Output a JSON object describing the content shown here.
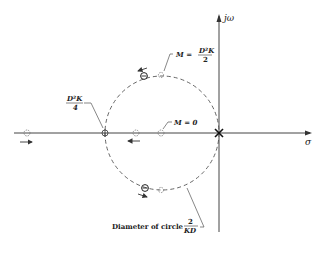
{
  "diagram": {
    "type": "root-locus",
    "axes": {
      "vertical_label": "jω",
      "horizontal_label": "σ"
    },
    "labels": {
      "m_top": {
        "lhs": "M =",
        "num": "D²K",
        "den": "2"
      },
      "break_in": {
        "num": "D²K",
        "den": "4"
      },
      "m_zero": "M = 0",
      "diameter": {
        "text": "Diameter of circle",
        "num": "2",
        "den": "KD"
      }
    },
    "colors": {
      "line": "#333333",
      "dashed_circle": "#555555",
      "background": "#ffffff"
    }
  }
}
